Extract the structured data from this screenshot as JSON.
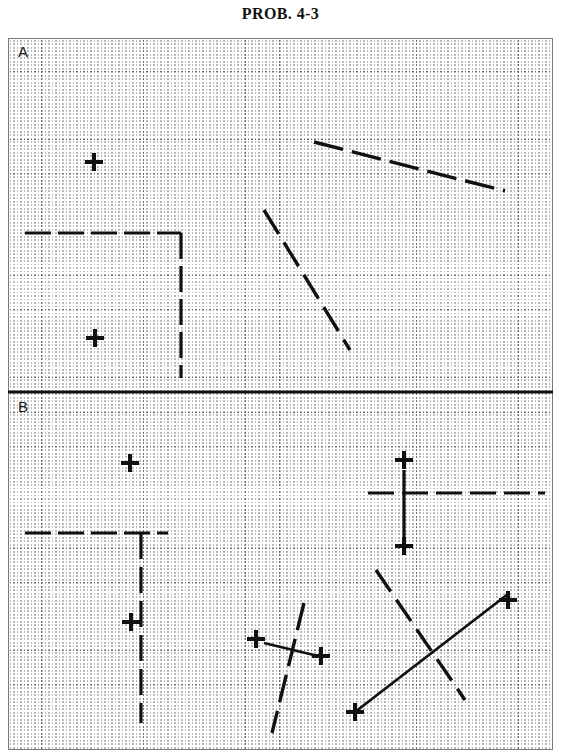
{
  "title": "PROB. 4-3",
  "sheet": {
    "grid": {
      "fine_spacing_px": 11.35,
      "coarse_spacing_px": 34.05,
      "fine_color": "#c2c2c2",
      "coarse_color": "#6e6e6e",
      "border_color": "#7a7a7a",
      "background": "#ffffff",
      "style": "dotted"
    },
    "ink_color": "#111111"
  },
  "panels": [
    {
      "id": "A",
      "label": "A",
      "label_pos": {
        "x": 10,
        "y": 5
      },
      "marks": [
        {
          "name": "cross-a-1",
          "x": 86,
          "y": 124,
          "size": 18,
          "thickness": 4
        },
        {
          "name": "cross-a-2",
          "x": 87,
          "y": 300,
          "size": 18,
          "thickness": 4
        }
      ],
      "lines": [
        {
          "name": "line-a-horizontal",
          "x1": 17,
          "y1": 195,
          "x2": 173,
          "y2": 195,
          "style": "dashed",
          "dash": "26,7",
          "width": 3.2
        },
        {
          "name": "line-a-vertical",
          "x1": 173,
          "y1": 195,
          "x2": 173,
          "y2": 340,
          "style": "dashed",
          "dash": "26,7",
          "width": 3.2
        },
        {
          "name": "line-a-shallow-diagonal",
          "x1": 306,
          "y1": 104,
          "x2": 497,
          "y2": 153,
          "style": "dashed",
          "dash": "30,9",
          "width": 3.4
        },
        {
          "name": "line-a-steep-diagonal",
          "x1": 256,
          "y1": 172,
          "x2": 342,
          "y2": 312,
          "style": "dashed",
          "dash": "28,10",
          "width": 3.4
        }
      ]
    },
    {
      "id": "B",
      "label": "B",
      "label_pos": {
        "x": 10,
        "y": 360
      },
      "marks": [
        {
          "name": "cross-b-1",
          "x": 122,
          "y": 425,
          "size": 18,
          "thickness": 4
        },
        {
          "name": "cross-b-2",
          "x": 123,
          "y": 584,
          "size": 18,
          "thickness": 4
        },
        {
          "name": "cross-b-3",
          "x": 396,
          "y": 422,
          "size": 18,
          "thickness": 4
        },
        {
          "name": "cross-b-4",
          "x": 396,
          "y": 508,
          "size": 18,
          "thickness": 4
        },
        {
          "name": "cross-b-5",
          "x": 248,
          "y": 601,
          "size": 18,
          "thickness": 4
        },
        {
          "name": "cross-b-6",
          "x": 313,
          "y": 618,
          "size": 18,
          "thickness": 4
        },
        {
          "name": "cross-b-7",
          "x": 347,
          "y": 674,
          "size": 18,
          "thickness": 4
        },
        {
          "name": "cross-b-8",
          "x": 500,
          "y": 562,
          "size": 18,
          "thickness": 4
        }
      ],
      "lines": [
        {
          "name": "line-b-horizontal-left",
          "x1": 17,
          "y1": 495,
          "x2": 160,
          "y2": 495,
          "style": "dashed",
          "dash": "26,7",
          "width": 3.2
        },
        {
          "name": "line-b-vertical-left",
          "x1": 133,
          "y1": 495,
          "x2": 133,
          "y2": 685,
          "style": "dashed",
          "dash": "26,8",
          "width": 3.2
        },
        {
          "name": "line-b-horizontal-right",
          "x1": 360,
          "y1": 455,
          "x2": 537,
          "y2": 455,
          "style": "dashed",
          "dash": "26,8",
          "width": 3.2
        },
        {
          "name": "line-b-vertical-right",
          "x1": 396,
          "y1": 432,
          "x2": 396,
          "y2": 508,
          "style": "solid",
          "dash": "",
          "width": 3.2
        },
        {
          "name": "line-b-steep-mid",
          "x1": 296,
          "y1": 565,
          "x2": 264,
          "y2": 695,
          "style": "dashed",
          "dash": "28,9",
          "width": 3.4
        },
        {
          "name": "line-b-short-horizontal",
          "x1": 256,
          "y1": 605,
          "x2": 310,
          "y2": 618,
          "style": "solid",
          "dash": "",
          "width": 2.6
        },
        {
          "name": "line-b-dashed-down-right",
          "x1": 368,
          "y1": 532,
          "x2": 457,
          "y2": 662,
          "style": "dashed",
          "dash": "26,10",
          "width": 3.4
        },
        {
          "name": "line-b-solid-up-right",
          "x1": 347,
          "y1": 674,
          "x2": 500,
          "y2": 556,
          "style": "solid",
          "dash": "",
          "width": 2.8
        }
      ]
    }
  ],
  "divider": {
    "name": "panel-divider",
    "x1": 0,
    "y1": 354,
    "x2": 545,
    "y2": 354,
    "width": 3.2,
    "color": "#111111"
  }
}
